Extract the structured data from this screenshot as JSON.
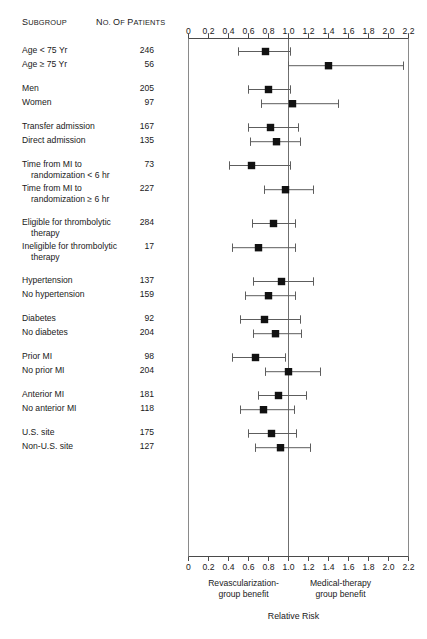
{
  "figure": {
    "columns": {
      "subgroup_header": "Subgroup",
      "patients_header": "No. of Patients"
    },
    "axis": {
      "ticks": [
        "0",
        "0.2",
        "0.4",
        "0.6",
        "0.8",
        "1.0",
        "1.2",
        "1.4",
        "1.6",
        "1.8",
        "2.0",
        "2.2"
      ],
      "min": 0,
      "max": 2.2,
      "step": 0.2,
      "null_value": 1.0,
      "title": "Relative Risk",
      "left_benefit_line1": "Revascularization-",
      "left_benefit_line2": "group benefit",
      "right_benefit_line1": "Medical-therapy",
      "right_benefit_line2": "group benefit"
    }
  },
  "chart_data": {
    "type": "forest",
    "title": "",
    "xlabel": "Relative Risk",
    "ylabel": "",
    "xlim": [
      0,
      2.2
    ],
    "xticks": [
      0,
      0.2,
      0.4,
      0.6,
      0.8,
      1.0,
      1.2,
      1.4,
      1.6,
      1.8,
      2.0,
      2.2
    ],
    "reference_line": 1.0,
    "grid": false,
    "legend": "none",
    "annotations": [
      "Revascularization-group benefit",
      "Medical-therapy group benefit"
    ],
    "columns": [
      "Subgroup",
      "No. of Patients",
      "Relative Risk",
      "95% CI low",
      "95% CI high"
    ],
    "rows": [
      {
        "label": "Age < 75 Yr",
        "label_line2": "",
        "n": "246",
        "rr": 0.77,
        "low": 0.5,
        "high": 1.02,
        "group": 0
      },
      {
        "label": "Age ≥ 75 Yr",
        "label_line2": "",
        "n": "56",
        "rr": 1.4,
        "low": 1.0,
        "high": 2.15,
        "group": 0
      },
      {
        "label": "Men",
        "label_line2": "",
        "n": "205",
        "rr": 0.8,
        "low": 0.6,
        "high": 1.02,
        "group": 1
      },
      {
        "label": "Women",
        "label_line2": "",
        "n": "97",
        "rr": 1.04,
        "low": 0.73,
        "high": 1.5,
        "group": 1
      },
      {
        "label": "Transfer admission",
        "label_line2": "",
        "n": "167",
        "rr": 0.82,
        "low": 0.6,
        "high": 1.1,
        "group": 2
      },
      {
        "label": "Direct admission",
        "label_line2": "",
        "n": "135",
        "rr": 0.88,
        "low": 0.62,
        "high": 1.12,
        "group": 2
      },
      {
        "label": "Time from MI to",
        "label_line2": "randomization < 6 hr",
        "n": "73",
        "rr": 0.63,
        "low": 0.41,
        "high": 1.02,
        "group": 3
      },
      {
        "label": "Time from MI to",
        "label_line2": "randomization ≥ 6 hr",
        "n": "227",
        "rr": 0.97,
        "low": 0.76,
        "high": 1.25,
        "group": 3
      },
      {
        "label": "Eligible for thrombolytic",
        "label_line2": "therapy",
        "n": "284",
        "rr": 0.85,
        "low": 0.64,
        "high": 1.07,
        "group": 4
      },
      {
        "label": "Ineligible for thrombolytic",
        "label_line2": "therapy",
        "n": "17",
        "rr": 0.7,
        "low": 0.44,
        "high": 1.07,
        "group": 4
      },
      {
        "label": "Hypertension",
        "label_line2": "",
        "n": "137",
        "rr": 0.93,
        "low": 0.65,
        "high": 1.25,
        "group": 5
      },
      {
        "label": "No hypertension",
        "label_line2": "",
        "n": "159",
        "rr": 0.8,
        "low": 0.57,
        "high": 1.07,
        "group": 5
      },
      {
        "label": "Diabetes",
        "label_line2": "",
        "n": "92",
        "rr": 0.76,
        "low": 0.52,
        "high": 1.12,
        "group": 6
      },
      {
        "label": "No diabetes",
        "label_line2": "",
        "n": "204",
        "rr": 0.87,
        "low": 0.65,
        "high": 1.13,
        "group": 6
      },
      {
        "label": "Prior MI",
        "label_line2": "",
        "n": "98",
        "rr": 0.67,
        "low": 0.44,
        "high": 0.97,
        "group": 7
      },
      {
        "label": "No prior MI",
        "label_line2": "",
        "n": "204",
        "rr": 1.0,
        "low": 0.77,
        "high": 1.32,
        "group": 7
      },
      {
        "label": "Anterior MI",
        "label_line2": "",
        "n": "181",
        "rr": 0.9,
        "low": 0.7,
        "high": 1.18,
        "group": 8
      },
      {
        "label": "No anterior MI",
        "label_line2": "",
        "n": "118",
        "rr": 0.75,
        "low": 0.52,
        "high": 1.06,
        "group": 8
      },
      {
        "label": "U.S. site",
        "label_line2": "",
        "n": "175",
        "rr": 0.83,
        "low": 0.6,
        "high": 1.08,
        "group": 9
      },
      {
        "label": "Non-U.S. site",
        "label_line2": "",
        "n": "127",
        "rr": 0.92,
        "low": 0.67,
        "high": 1.22,
        "group": 9
      }
    ]
  },
  "colors": {
    "marker": "#111111",
    "ci": "#5d5d5d",
    "axis": "#4a4a4a",
    "frame": "#8a8a8a",
    "text": "#1a1a1a"
  }
}
